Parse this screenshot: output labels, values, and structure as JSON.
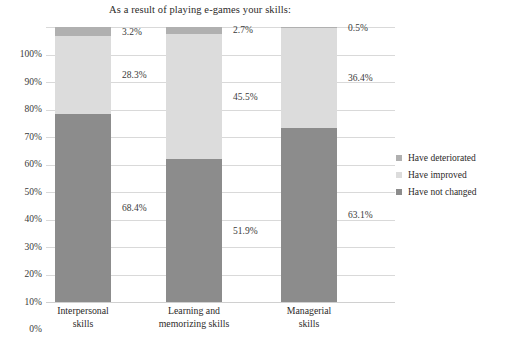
{
  "chart_data": {
    "type": "bar",
    "subtype": "stacked-100-percent",
    "title": "As a result of playing e-games your skills:",
    "xlabel": "",
    "ylabel": "",
    "ylim": [
      0,
      100
    ],
    "yticks": [
      "0%",
      "10%",
      "20%",
      "30%",
      "40%",
      "50%",
      "60%",
      "70%",
      "80%",
      "90%",
      "100%"
    ],
    "grid": true,
    "legend_position": "right",
    "categories": [
      "Interpersonal skills",
      "Learning and memorizing skills",
      "Managerial skills"
    ],
    "category_lines": [
      [
        "Interpersonal",
        "skills"
      ],
      [
        "Learning and",
        "memorizing skills"
      ],
      [
        "Managerial",
        "skills"
      ]
    ],
    "series": [
      {
        "name": "Have not changed",
        "color": "#8c8c8c",
        "values": [
          68.4,
          51.9,
          63.1
        ],
        "labels": [
          "68.4%",
          "51.9%",
          "63.1%"
        ]
      },
      {
        "name": "Have improved",
        "color": "#dcdcdc",
        "values": [
          28.3,
          45.5,
          36.4
        ],
        "labels": [
          "28.3%",
          "45.5%",
          "36.4%"
        ]
      },
      {
        "name": "Have deteriorated",
        "color": "#b0b0b0",
        "values": [
          3.2,
          2.7,
          0.5
        ],
        "labels": [
          "3.2%",
          "2.7%",
          "0.5%"
        ]
      }
    ],
    "legend_entries": [
      {
        "label": "Have deteriorated",
        "color": "#b0b0b0"
      },
      {
        "label": "Have improved",
        "color": "#dcdcdc"
      },
      {
        "label": "Have not changed",
        "color": "#8c8c8c"
      }
    ]
  }
}
